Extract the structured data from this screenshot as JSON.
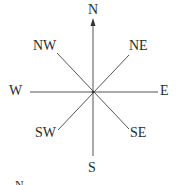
{
  "diagram": {
    "type": "compass-rose",
    "center": {
      "x": 93,
      "y": 92
    },
    "line_color": "#555555",
    "directions": {
      "n": "N",
      "ne": "NE",
      "e": "E",
      "se": "SE",
      "s": "S",
      "sw": "SW",
      "w": "W",
      "nw": "NW"
    },
    "footer_partial_label": "N"
  }
}
